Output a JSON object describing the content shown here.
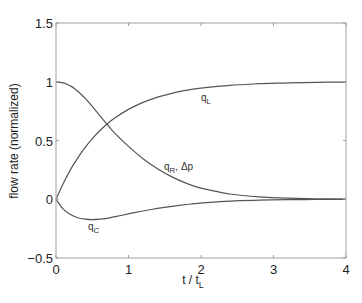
{
  "chart_data": {
    "type": "line",
    "title": "",
    "xlabel": "t / t_L",
    "ylabel": "flow rate (normalized)",
    "xlim": [
      0,
      4
    ],
    "ylim": [
      -0.5,
      1.5
    ],
    "xticks": [
      "0",
      "1",
      "2",
      "3",
      "4"
    ],
    "yticks": [
      "−0.5",
      "0",
      "0.5",
      "1",
      "1.5"
    ],
    "grid": false,
    "legend": "none (inline curve labels)",
    "x": [
      0,
      0.1,
      0.2,
      0.3,
      0.4,
      0.5,
      0.6,
      0.7,
      0.8,
      1.0,
      1.2,
      1.4,
      1.6,
      1.8,
      2.0,
      2.4,
      2.8,
      3.2,
      3.6,
      4.0
    ],
    "series": [
      {
        "name": "q_L",
        "label": "q",
        "subscript": "L",
        "values": [
          0,
          0.135,
          0.252,
          0.353,
          0.44,
          0.516,
          0.581,
          0.638,
          0.687,
          0.765,
          0.824,
          0.869,
          0.902,
          0.927,
          0.945,
          0.969,
          0.983,
          0.99,
          0.995,
          0.997
        ]
      },
      {
        "name": "q_R, Δp",
        "label": "q",
        "subscript": "R",
        "suffix": ", Δp",
        "values": [
          1,
          0.99,
          0.965,
          0.92,
          0.86,
          0.79,
          0.715,
          0.64,
          0.57,
          0.45,
          0.345,
          0.26,
          0.19,
          0.135,
          0.095,
          0.045,
          0.02,
          0.009,
          0.004,
          0.002
        ]
      },
      {
        "name": "q_C",
        "label": "q",
        "subscript": "C",
        "values": [
          0,
          -0.085,
          -0.13,
          -0.158,
          -0.17,
          -0.174,
          -0.17,
          -0.162,
          -0.15,
          -0.125,
          -0.1,
          -0.078,
          -0.06,
          -0.045,
          -0.033,
          -0.017,
          -0.008,
          -0.004,
          -0.002,
          -0.001
        ]
      }
    ],
    "annotations": [
      {
        "text": "q_L",
        "x": 2.05,
        "y": 0.86
      },
      {
        "text": "q_R, Δp",
        "x": 1.35,
        "y": 0.33
      },
      {
        "text": "q_C",
        "x": 0.45,
        "y": -0.26
      }
    ]
  },
  "axes": {
    "xlabel_main": "t / t",
    "xlabel_sub": "L",
    "ylabel": "flow rate (normalized)"
  },
  "labels": {
    "qL_main": "q",
    "qL_sub": "L",
    "qR_main": "q",
    "qR_sub": "R",
    "qR_suffix": ", Δp",
    "qC_main": "q",
    "qC_sub": "C"
  },
  "colors": {
    "line": "#555555",
    "axis": "#999999",
    "text": "#222222"
  }
}
